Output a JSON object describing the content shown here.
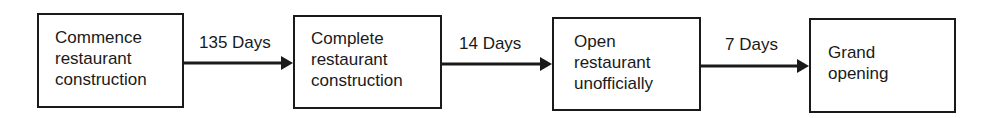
{
  "nodes": [
    {
      "id": "commence",
      "label": "Commence\nrestaurant\nconstruction"
    },
    {
      "id": "complete",
      "label": "Complete\nrestaurant\nconstruction"
    },
    {
      "id": "open_unofficial",
      "label": "Open\nrestaurant\nunofficially"
    },
    {
      "id": "grand_opening",
      "label": "Grand\nopening"
    }
  ],
  "edges": [
    {
      "from": "commence",
      "to": "complete",
      "label": "135 Days"
    },
    {
      "from": "complete",
      "to": "open_unofficial",
      "label": "14 Days"
    },
    {
      "from": "open_unofficial",
      "to": "grand_opening",
      "label": "7 Days"
    }
  ]
}
